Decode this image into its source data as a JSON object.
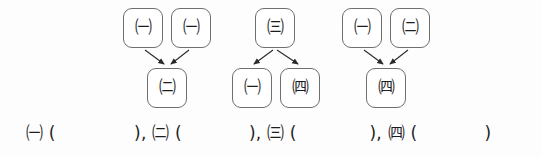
{
  "page": {
    "background_color": "#fdfdfd",
    "box_border_color": "#6f6f6f",
    "ink_color": "#1d1d1d"
  },
  "diagrams": [
    {
      "id": "group-1",
      "direction": "converge",
      "top_nodes": [
        {
          "label": "㈠",
          "letter": "ㄱ",
          "x": 123,
          "y": 8
        },
        {
          "label": "㈠",
          "letter": "ㄱ",
          "x": 171,
          "y": 8
        }
      ],
      "bottom_nodes": [
        {
          "label": "㈡",
          "letter": "ㄴ",
          "x": 147,
          "y": 68
        }
      ]
    },
    {
      "id": "group-2",
      "direction": "diverge",
      "top_nodes": [
        {
          "label": "㈢",
          "letter": "ㄷ",
          "x": 255,
          "y": 8
        }
      ],
      "bottom_nodes": [
        {
          "label": "㈠",
          "letter": "ㄱ",
          "x": 232,
          "y": 68
        },
        {
          "label": "㈣",
          "letter": "ㄹ",
          "x": 280,
          "y": 68
        }
      ]
    },
    {
      "id": "group-3",
      "direction": "converge",
      "top_nodes": [
        {
          "label": "㈠",
          "letter": "ㄱ",
          "x": 342,
          "y": 8
        },
        {
          "label": "㈡",
          "letter": "ㄴ",
          "x": 390,
          "y": 8
        }
      ],
      "bottom_nodes": [
        {
          "label": "㈣",
          "letter": "ㄹ",
          "x": 366,
          "y": 68
        }
      ]
    }
  ],
  "answer_line": {
    "text": "㈠ (              ), ㈡ (            ), ㈢ (             ), ㈣ (            )",
    "blanks": [
      {
        "label": "㈠",
        "value": ""
      },
      {
        "label": "㈡",
        "value": ""
      },
      {
        "label": "㈢",
        "value": ""
      },
      {
        "label": "㈣",
        "value": ""
      }
    ]
  }
}
